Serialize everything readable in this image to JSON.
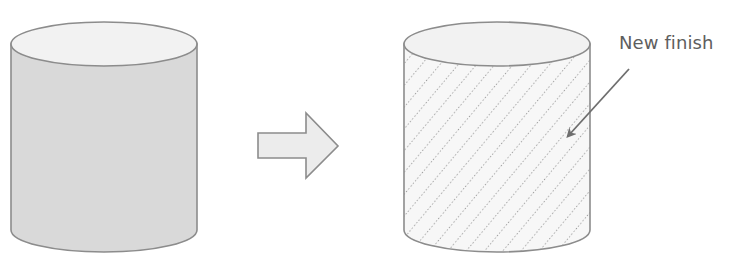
{
  "diagram": {
    "type": "before-after illustration",
    "before": {
      "name": "original-cylinder",
      "fill": "#d9d9d9",
      "top_fill": "#f2f2f2",
      "stroke": "#8c8c8c"
    },
    "transition": {
      "name": "transform-arrow",
      "fill": "#ececec",
      "stroke": "#8c8c8c"
    },
    "after": {
      "name": "refinished-cylinder",
      "fill": "#f7f7f7",
      "top_fill": "#f2f2f2",
      "stroke": "#8c8c8c",
      "pattern": "diagonal-dotted-hatch"
    },
    "callout": {
      "label": "New finish",
      "color": "#5e5e5e"
    }
  }
}
